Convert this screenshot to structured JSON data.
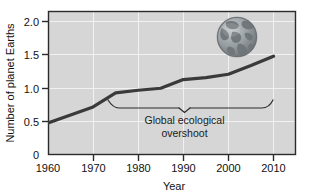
{
  "chart_data": {
    "type": "line",
    "title": "",
    "subtitle": "",
    "xlabel": "Year",
    "ylabel": "Number of planet Earths",
    "xlim": [
      1960,
      2012
    ],
    "ylim": [
      0,
      2.1
    ],
    "xticks": [
      "1960",
      "1970",
      "1980",
      "1990",
      "2000",
      "2010"
    ],
    "xtick_values": [
      1960,
      1970,
      1980,
      1990,
      2000,
      2010
    ],
    "yticks": [
      "0",
      "0.5",
      "1.0",
      "1.5",
      "2.0"
    ],
    "ytick_values": [
      0,
      0.5,
      1.0,
      1.5,
      2.0
    ],
    "grid": "white gridlines at each tick, vertical and horizontal",
    "legend": "none",
    "series": [
      {
        "name": "Humanity's Ecological Footprint",
        "x": [
          1960,
          1965,
          1970,
          1975,
          1980,
          1985,
          1990,
          1995,
          2000,
          2005,
          2010
        ],
        "values": [
          0.48,
          0.6,
          0.72,
          0.93,
          0.97,
          1.0,
          1.13,
          1.16,
          1.21,
          1.34,
          1.48
        ],
        "color": "#3a3a3a",
        "line_width": 3
      }
    ],
    "annotations": [
      {
        "name": "global-ecological-overshoot",
        "text_line_1": "Global ecological",
        "text_line_2": "overshoot",
        "bracket_x_start": 1975,
        "bracket_x_end": 2010,
        "bracket_y": 0.88,
        "pointer_x": 1993
      }
    ],
    "inset_image": {
      "name": "earth-globe",
      "description": "Globe showing the Americas",
      "center_x_year": 2002,
      "center_y_value": 1.78
    },
    "colors": {
      "plot_background": "#d6d6d6",
      "figure_background": "#ffffff",
      "axis": "#2b2b2b",
      "gridline": "#f2f2f2",
      "line": "#3a3a3a",
      "text": "#111111",
      "globe_ocean": "#9aa0a4",
      "globe_land": "#7c8286"
    }
  }
}
